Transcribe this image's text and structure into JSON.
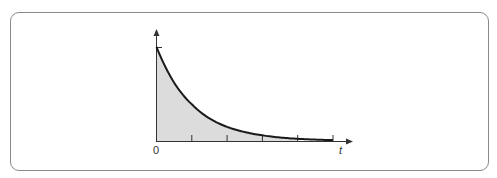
{
  "chart_data": {
    "type": "area",
    "title": "",
    "xlabel": "t",
    "ylabel": "",
    "x_tick_labels": [
      "0"
    ],
    "x_ticks": [
      0,
      1,
      2,
      3,
      4,
      5
    ],
    "x": [
      0,
      0.25,
      0.5,
      0.75,
      1,
      1.5,
      2,
      2.5,
      3,
      3.5,
      4,
      4.5,
      5
    ],
    "series": [
      {
        "name": "exponential decay",
        "values": [
          1.0,
          0.79,
          0.62,
          0.49,
          0.39,
          0.24,
          0.15,
          0.095,
          0.06,
          0.037,
          0.023,
          0.015,
          0.009
        ]
      }
    ],
    "shaded_region": {
      "from": 0,
      "to": 4.0,
      "color": "#dcdcdc"
    },
    "xlim": [
      0,
      5.5
    ],
    "ylim": [
      0,
      1.1
    ],
    "grid": false,
    "legend": "none",
    "colors": {
      "curve": "#1a1a1a",
      "fill": "#dcdcdc",
      "axis": "#333333",
      "frame": "#8a8a8a"
    }
  },
  "labels": {
    "origin": "0",
    "x_axis": "t"
  }
}
